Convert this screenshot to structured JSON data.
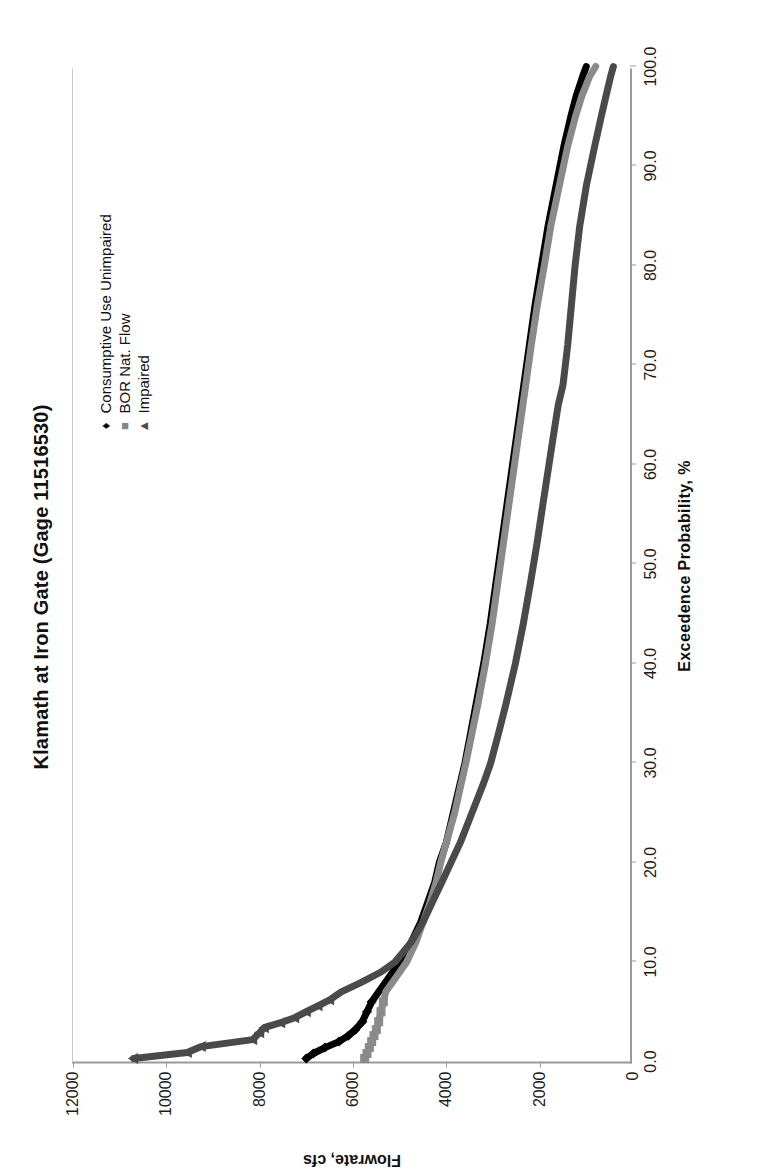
{
  "chart_data": {
    "type": "line",
    "title": "Klamath at Iron Gate (Gage 11516530)",
    "xlabel": "Exceedence Probability, %",
    "ylabel": "Flowrate, cfs",
    "xlim": [
      0,
      100
    ],
    "ylim": [
      0,
      12000
    ],
    "xticks": [
      "0.0",
      "10.0",
      "20.0",
      "30.0",
      "40.0",
      "50.0",
      "60.0",
      "70.0",
      "80.0",
      "90.0",
      "100.0"
    ],
    "yticks": [
      "0",
      "2000",
      "4000",
      "6000",
      "8000",
      "10000",
      "12000"
    ],
    "grid": false,
    "legend_position": "top-right",
    "series": [
      {
        "name": "Consumptive Use Unimpaired",
        "marker": "diamond",
        "color": "#000000",
        "x": [
          0.3,
          0.8,
          1.4,
          2.0,
          2.6,
          3.2,
          4.0,
          5.0,
          6.0,
          7.0,
          8.0,
          9.0,
          10.0,
          12.0,
          14.0,
          16.0,
          18.0,
          20.0,
          22.0,
          25.0,
          28.0,
          30.0,
          33.0,
          36.0,
          40.0,
          44.0,
          48.0,
          52.0,
          56.0,
          60.0,
          64.0,
          68.0,
          72.0,
          76.0,
          80.0,
          84.0,
          88.0,
          92.0,
          95.0,
          97.0,
          99.0,
          100.0
        ],
        "y": [
          7000,
          6850,
          6600,
          6300,
          6100,
          5950,
          5800,
          5700,
          5600,
          5450,
          5300,
          5150,
          5000,
          4750,
          4550,
          4400,
          4250,
          4150,
          4000,
          3850,
          3700,
          3600,
          3480,
          3360,
          3200,
          3060,
          2940,
          2820,
          2700,
          2580,
          2460,
          2340,
          2220,
          2100,
          1960,
          1820,
          1650,
          1480,
          1330,
          1220,
          1080,
          1000
        ]
      },
      {
        "name": "BOR Nat. Flow",
        "marker": "square",
        "color": "#8a8a8a",
        "x": [
          0.3,
          0.8,
          1.4,
          2.0,
          2.6,
          3.2,
          4.0,
          5.0,
          6.0,
          7.0,
          8.0,
          9.0,
          10.0,
          12.0,
          14.0,
          16.0,
          18.0,
          20.0,
          22.0,
          25.0,
          28.0,
          30.0,
          33.0,
          36.0,
          40.0,
          44.0,
          48.0,
          52.0,
          56.0,
          60.0,
          64.0,
          68.0,
          72.0,
          76.0,
          80.0,
          84.0,
          88.0,
          92.0,
          95.0,
          97.0,
          99.0,
          100.0
        ],
        "y": [
          5750,
          5700,
          5650,
          5600,
          5550,
          5500,
          5450,
          5400,
          5350,
          5300,
          5150,
          5000,
          4850,
          4650,
          4500,
          4350,
          4220,
          4120,
          4000,
          3820,
          3680,
          3580,
          3450,
          3320,
          3160,
          3020,
          2900,
          2780,
          2660,
          2540,
          2420,
          2300,
          2180,
          2050,
          1900,
          1760,
          1580,
          1400,
          1230,
          1100,
          930,
          800
        ]
      },
      {
        "name": "Impaired",
        "marker": "triangle",
        "color": "#4a4a4a",
        "x": [
          0.3,
          0.9,
          1.5,
          2.2,
          2.9,
          3.4,
          3.9,
          4.4,
          5.0,
          5.6,
          6.2,
          7.0,
          8.0,
          9.0,
          10.0,
          12.0,
          14.0,
          16.0,
          18.0,
          20.0,
          22.0,
          25.0,
          28.0,
          30.0,
          33.0,
          36.0,
          40.0,
          44.0,
          48.0,
          52.0,
          56.0,
          60.0,
          64.0,
          66.0,
          68.0,
          72.0,
          76.0,
          80.0,
          84.0,
          88.0,
          92.0,
          95.0,
          97.0,
          99.0,
          100.0
        ],
        "y": [
          10700,
          9550,
          9250,
          8150,
          8000,
          7900,
          7550,
          7250,
          7000,
          6750,
          6500,
          6250,
          5800,
          5400,
          5100,
          4750,
          4500,
          4300,
          4100,
          3900,
          3700,
          3450,
          3200,
          3050,
          2880,
          2720,
          2520,
          2350,
          2200,
          2060,
          1930,
          1800,
          1670,
          1600,
          1500,
          1400,
          1320,
          1240,
          1140,
          1000,
          820,
          680,
          580,
          480,
          420
        ]
      }
    ]
  }
}
